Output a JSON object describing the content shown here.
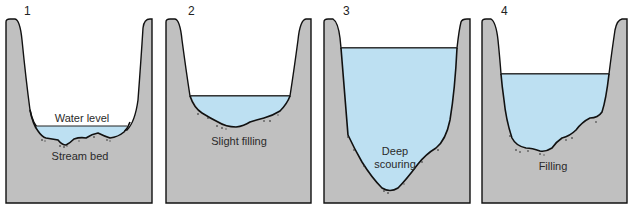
{
  "colors": {
    "rock": "#c0c0c0",
    "water": "#bde0f2",
    "outline": "#111111",
    "background": "#ffffff"
  },
  "panels": [
    {
      "number": "1",
      "labels": [
        "Water level",
        "Stream bed"
      ],
      "state": "normal flow"
    },
    {
      "number": "2",
      "labels": [
        "Slight filling"
      ],
      "state": "slight filling"
    },
    {
      "number": "3",
      "labels": [
        "Deep",
        "scouring"
      ],
      "state": "deep scouring"
    },
    {
      "number": "4",
      "labels": [
        "Filling"
      ],
      "state": "filling"
    }
  ]
}
